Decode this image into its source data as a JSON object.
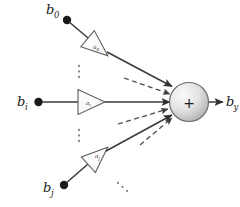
{
  "figure": {
    "background_color": "#ffffff",
    "line_color": "#3a3a3a",
    "dashed_color": "#4a4a4a",
    "node_fill_light": "#f2f2f2",
    "node_fill_dark": "#b9b9b9",
    "node_stroke": "#6e6e6e",
    "dot_color": "#1a1a1a"
  },
  "inputs": [
    {
      "id": "input-top",
      "signal_base": "b",
      "signal_sub": "0",
      "signal_label": "b0",
      "gain_base": "a",
      "gain_sub": "0",
      "gain_label": "a0",
      "orientation": "diagonal-down-right"
    },
    {
      "id": "input-middle",
      "signal_base": "b",
      "signal_sub": "i",
      "signal_label": "bi",
      "gain_base": "a",
      "gain_sub": "i",
      "gain_label": "ai",
      "orientation": "horizontal"
    },
    {
      "id": "input-bottom",
      "signal_base": "b",
      "signal_sub": "j",
      "signal_label": "bj",
      "gain_base": "a",
      "gain_sub": "j",
      "gain_label": "aj",
      "orientation": "diagonal-up-right"
    }
  ],
  "summation_node": {
    "symbol": "+",
    "shape": "circle",
    "label": "summation-node"
  },
  "output": {
    "signal_base": "b",
    "signal_sub": "y",
    "signal_label": "by"
  },
  "ellipses": [
    {
      "id": "ellipsis-upper",
      "style": "vertical",
      "dots": 3
    },
    {
      "id": "ellipsis-lower",
      "style": "vertical",
      "dots": 3
    },
    {
      "id": "ellipsis-corner",
      "style": "diagonal",
      "dots": 3
    }
  ],
  "dashed_arrows": [
    {
      "id": "dashed-arrow-upper",
      "direction": "into-node-from-upper-left"
    },
    {
      "id": "dashed-arrow-lower-1",
      "direction": "into-node-from-lower-left"
    },
    {
      "id": "dashed-arrow-lower-2",
      "direction": "into-node-from-lower-left"
    }
  ]
}
